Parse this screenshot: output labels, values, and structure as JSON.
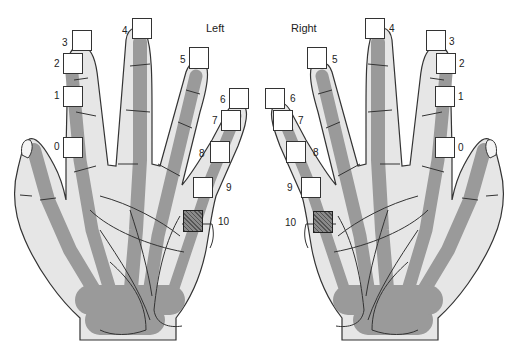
{
  "figure": {
    "left_hand": {
      "label": "Left",
      "electrodes": [
        {
          "id": "0",
          "label": "0",
          "x": 63,
          "y": 137,
          "w": 20,
          "h": 21,
          "style": "open",
          "lx": 54,
          "ly": 142
        },
        {
          "id": "1",
          "label": "1",
          "x": 63,
          "y": 86,
          "w": 20,
          "h": 21,
          "style": "open",
          "lx": 54,
          "ly": 91
        },
        {
          "id": "2",
          "label": "2",
          "x": 63,
          "y": 53,
          "w": 20,
          "h": 21,
          "style": "open",
          "lx": 54,
          "ly": 59
        },
        {
          "id": "3",
          "label": "3",
          "x": 72,
          "y": 30,
          "w": 20,
          "h": 21,
          "style": "open",
          "lx": 62,
          "ly": 38
        },
        {
          "id": "4",
          "label": "4",
          "x": 132,
          "y": 18,
          "w": 20,
          "h": 21,
          "style": "open",
          "lx": 122,
          "ly": 26
        },
        {
          "id": "5",
          "label": "5",
          "x": 189,
          "y": 47,
          "w": 20,
          "h": 22,
          "style": "open",
          "lx": 180,
          "ly": 55
        },
        {
          "id": "6",
          "label": "6",
          "x": 229,
          "y": 88,
          "w": 20,
          "h": 21,
          "style": "open",
          "lx": 220,
          "ly": 95
        },
        {
          "id": "7",
          "label": "7",
          "x": 221,
          "y": 110,
          "w": 20,
          "h": 21,
          "style": "open",
          "lx": 212,
          "ly": 116
        },
        {
          "id": "8",
          "label": "8",
          "x": 210,
          "y": 141,
          "w": 20,
          "h": 22,
          "style": "open",
          "lx": 199,
          "ly": 149
        },
        {
          "id": "9",
          "label": "9",
          "x": 193,
          "y": 177,
          "w": 20,
          "h": 21,
          "style": "open",
          "lx": 226,
          "ly": 183
        },
        {
          "id": "10",
          "label": "10",
          "x": 183,
          "y": 210,
          "w": 20,
          "h": 22,
          "style": "hatched",
          "lx": 218,
          "ly": 217
        }
      ]
    },
    "right_hand": {
      "label": "Right",
      "electrodes": [
        {
          "id": "0",
          "label": "0",
          "x": 435,
          "y": 137,
          "w": 20,
          "h": 21,
          "style": "open",
          "lx": 458,
          "ly": 143
        },
        {
          "id": "1",
          "label": "1",
          "x": 435,
          "y": 86,
          "w": 20,
          "h": 21,
          "style": "open",
          "lx": 458,
          "ly": 92
        },
        {
          "id": "2",
          "label": "2",
          "x": 436,
          "y": 53,
          "w": 20,
          "h": 21,
          "style": "open",
          "lx": 459,
          "ly": 59
        },
        {
          "id": "3",
          "label": "3",
          "x": 426,
          "y": 30,
          "w": 20,
          "h": 21,
          "style": "open",
          "lx": 449,
          "ly": 37
        },
        {
          "id": "4",
          "label": "4",
          "x": 365,
          "y": 18,
          "w": 20,
          "h": 21,
          "style": "open",
          "lx": 389,
          "ly": 24
        },
        {
          "id": "5",
          "label": "5",
          "x": 307,
          "y": 47,
          "w": 20,
          "h": 22,
          "style": "open",
          "lx": 332,
          "ly": 55
        },
        {
          "id": "6",
          "label": "6",
          "x": 265,
          "y": 88,
          "w": 20,
          "h": 21,
          "style": "open",
          "lx": 290,
          "ly": 94
        },
        {
          "id": "7",
          "label": "7",
          "x": 273,
          "y": 110,
          "w": 20,
          "h": 21,
          "style": "open",
          "lx": 298,
          "ly": 116
        },
        {
          "id": "8",
          "label": "8",
          "x": 286,
          "y": 141,
          "w": 20,
          "h": 22,
          "style": "open",
          "lx": 313,
          "ly": 148
        },
        {
          "id": "9",
          "label": "9",
          "x": 301,
          "y": 177,
          "w": 20,
          "h": 21,
          "style": "open",
          "lx": 287,
          "ly": 183
        },
        {
          "id": "10",
          "label": "10",
          "x": 313,
          "y": 211,
          "w": 20,
          "h": 22,
          "style": "hatched",
          "lx": 285,
          "ly": 218
        }
      ]
    },
    "colors": {
      "skin": "#e6e6e6",
      "bone": "#9a9a9a",
      "outline": "#333333",
      "box_fill": "#ffffff",
      "hatched_fill": "#777777"
    }
  }
}
